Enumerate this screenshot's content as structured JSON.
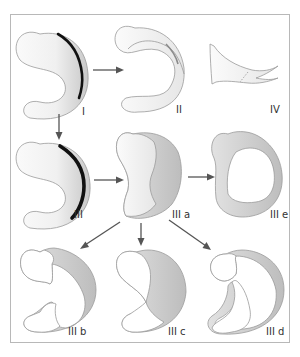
{
  "figure": {
    "colors": {
      "frame": "#b8b8b8",
      "shape_fill_light": "#f4f4f4",
      "shape_fill_dark": "#cfcfcf",
      "dark_band": "#111111",
      "arrow": "#555555",
      "label": "#333333"
    },
    "panels": [
      {
        "id": "I",
        "label": "I"
      },
      {
        "id": "II",
        "label": "II"
      },
      {
        "id": "IV",
        "label": "IV"
      },
      {
        "id": "III",
        "label": "III"
      },
      {
        "id": "IIIa",
        "label": "III a"
      },
      {
        "id": "IIIe",
        "label": "III e"
      },
      {
        "id": "IIIb",
        "label": "III b"
      },
      {
        "id": "IIIc",
        "label": "III c"
      },
      {
        "id": "IIId",
        "label": "III d"
      }
    ],
    "arrows": [
      {
        "from": "I",
        "to": "II"
      },
      {
        "from": "I",
        "to": "III"
      },
      {
        "from": "III",
        "to": "III a"
      },
      {
        "from": "III a",
        "to": "III e"
      },
      {
        "from": "III a",
        "to": "III b"
      },
      {
        "from": "III a",
        "to": "III c"
      },
      {
        "from": "III a",
        "to": "III d"
      }
    ]
  }
}
